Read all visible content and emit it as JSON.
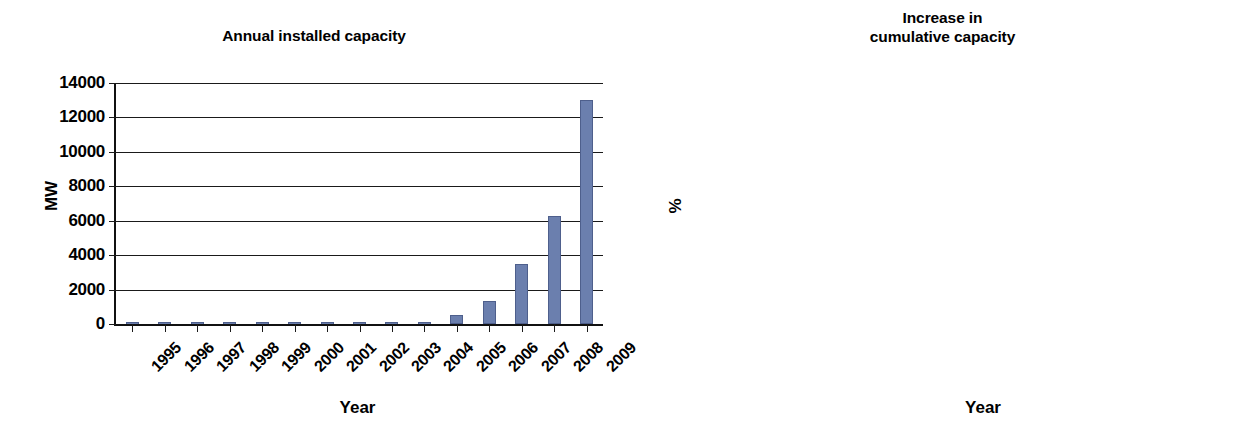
{
  "figure": {
    "background": "#ffffff",
    "series_color": "#6b7fae",
    "axis_color": "#1a1a1a"
  },
  "charts": [
    {
      "id": "annual-installed-capacity",
      "title": "Annual installed capacity",
      "title_lines": [
        "Annual installed capacity"
      ],
      "xlabel": "Year",
      "ylabel": "MW"
    },
    {
      "id": "increase-in-cumulative-capacity",
      "title": "Increase in cumulative capacity",
      "title_lines": [
        "Increase in",
        "cumulative capacity"
      ],
      "xlabel": "Year",
      "ylabel": "%"
    }
  ],
  "chart_data": [
    {
      "type": "bar",
      "title": "Annual installed capacity",
      "xlabel": "Year",
      "ylabel": "MW",
      "categories": [
        "1995",
        "1996",
        "1997",
        "1998",
        "1999",
        "2000",
        "2001",
        "2002",
        "2003",
        "2004",
        "2005",
        "2006",
        "2007",
        "2008",
        "2009"
      ],
      "values": [
        2,
        3,
        5,
        8,
        10,
        15,
        20,
        25,
        35,
        100,
        500,
        1350,
        3500,
        6300,
        13000
      ],
      "ylim": [
        0,
        14000
      ],
      "yticks": [
        0,
        2000,
        4000,
        6000,
        8000,
        10000,
        12000,
        14000
      ],
      "ytick_labels": [
        "0",
        "2000",
        "4000",
        "6000",
        "8000",
        "10000",
        "12000",
        "14000"
      ],
      "grid": true,
      "legend": false
    },
    {
      "type": "line",
      "title": "Increase in cumulative capacity",
      "xlabel": "Year",
      "ylabel": "%",
      "categories": [
        "1998",
        "1999",
        "2000",
        "2001",
        "2002",
        "2003",
        "2004",
        "2005",
        "2006",
        "2007",
        "2008",
        "2009"
      ],
      "x": [
        "1998",
        "1999",
        "2000",
        "2001",
        "2002",
        "2003",
        "2004",
        "2005",
        "2006",
        "2007",
        "2008",
        "2009"
      ],
      "values": [
        36,
        12,
        31,
        15,
        16,
        20,
        35,
        62,
        104,
        134,
        107,
        107
      ],
      "ylim": [
        0,
        140
      ],
      "yticks": [
        0,
        20,
        40,
        60,
        80,
        100,
        120,
        140
      ],
      "ytick_labels": [
        "0",
        "20",
        "40",
        "60",
        "80",
        "100",
        "120",
        "140"
      ],
      "grid": true,
      "legend": false
    }
  ]
}
